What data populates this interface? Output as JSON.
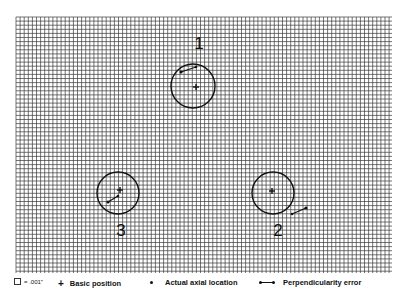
{
  "diagram": {
    "grid": {
      "x0": 16,
      "y0": 17,
      "x1": 392,
      "y1": 273,
      "spacing": 4.1,
      "unit_label": ".001\""
    },
    "holes": [
      {
        "label": "1",
        "label_x": 199,
        "label_y": 49,
        "circle": {
          "cx": 193,
          "cy": 86,
          "r": 22
        },
        "basic_position": {
          "x": 196,
          "y": 87
        },
        "error_line": {
          "x1": 196,
          "y1": 67,
          "x2": 181,
          "y2": 72
        }
      },
      {
        "label": "2",
        "label_x": 278,
        "label_y": 236,
        "circle": {
          "cx": 273,
          "cy": 193,
          "r": 21
        },
        "basic_position": {
          "x": 272,
          "y": 191
        },
        "error_line": {
          "x1": 292,
          "y1": 214,
          "x2": 306,
          "y2": 208
        }
      },
      {
        "label": "3",
        "label_x": 121,
        "label_y": 236,
        "circle": {
          "cx": 118,
          "cy": 193,
          "r": 21
        },
        "basic_position": {
          "x": 120,
          "y": 190
        },
        "error_line": {
          "x1": 118,
          "y1": 196,
          "x2": 108,
          "y2": 202
        }
      }
    ]
  },
  "legend": {
    "scale": "= .001\"",
    "basic_position": "Basic position",
    "actual_axial_location": "Actual axial location",
    "perpendicularity_error": "Perpendicularity error"
  }
}
